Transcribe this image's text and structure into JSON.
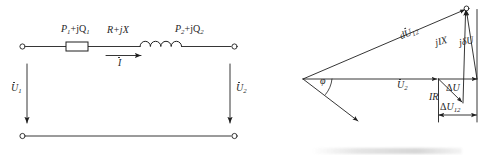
{
  "figure": {
    "stroke_color": "#1f1f1f",
    "background": "#ffffff"
  },
  "circuit_diagram": {
    "name": "single-phase-line-equivalent-circuit",
    "labels": {
      "sending_power": "P₁+jQ₁",
      "impedance": "R+jX",
      "current": "I",
      "receiving_power": "P₂+jQ₂",
      "sending_voltage": "U₁",
      "receiving_voltage": "U₂"
    },
    "label_parts": {
      "sending_power_main": "P",
      "sending_power_sub": "1",
      "sending_power_tail": "+jQ",
      "sending_power_sub2": "1",
      "receiving_power_main": "P",
      "receiving_power_sub": "2",
      "receiving_power_tail": "+jQ",
      "receiving_power_sub2": "2",
      "impedance_text": "R+jX",
      "current_text": "I",
      "u1_main": "U",
      "u1_sub": "1",
      "u2_main": "U",
      "u2_sub": "2"
    },
    "components": [
      {
        "name": "resistor",
        "type": "rectangle"
      },
      {
        "name": "inductor",
        "type": "coil",
        "loops": 4
      },
      {
        "name": "terminal-top-left",
        "type": "open-circle"
      },
      {
        "name": "terminal-top-right",
        "type": "open-circle"
      },
      {
        "name": "terminal-bottom-left",
        "type": "open-circle"
      },
      {
        "name": "terminal-bottom-right",
        "type": "open-circle"
      }
    ]
  },
  "phasor_diagram": {
    "name": "voltage-drop-phasor-diagram",
    "labels": {
      "phase_angle": "φ",
      "receiving_voltage": "U₂",
      "total_drop": "dU₁₂",
      "reactive_drop": "jIX",
      "quadrature_drop": "jδU",
      "resistive_drop": "IR",
      "longitudinal_drop": "ΔU",
      "transverse_drop": "ΔU₁₂"
    },
    "label_parts": {
      "phi": "φ",
      "u2_main": "U",
      "u2_sub": "2",
      "dU12_prefix": "d",
      "dU12_main": "U",
      "dU12_sub": "12",
      "jIX": "jIX",
      "jdU_j": "j",
      "jdU_delta": "δ",
      "jdU_u": "U",
      "IR": "IR",
      "deltaU_delta": "Δ",
      "deltaU_u": "U",
      "deltaU12_delta": "Δ",
      "deltaU12_u": "U",
      "deltaU12_sub": "12"
    },
    "vectors": [
      {
        "name": "u2-phasor",
        "label": "U₂",
        "from": [
          303,
          79
        ],
        "to": [
          438,
          79
        ]
      },
      {
        "name": "total-voltage-drop",
        "label": "dU₁₂",
        "from": [
          303,
          79
        ],
        "to": [
          466,
          9
        ]
      },
      {
        "name": "current-phasor",
        "label": "",
        "from": [
          303,
          79
        ],
        "to": [
          360,
          122
        ]
      },
      {
        "name": "resistive-drop",
        "label": "IR",
        "from": [
          438,
          79
        ],
        "to": [
          463,
          103
        ]
      },
      {
        "name": "reactive-drop",
        "label": "jIX",
        "from": [
          463,
          103
        ],
        "to": [
          466,
          9
        ]
      },
      {
        "name": "quadrature-drop",
        "label": "jδU",
        "from": [
          477,
          79
        ],
        "to": [
          466,
          9
        ]
      },
      {
        "name": "longitudinal-drop",
        "label": "ΔU",
        "from": [
          438,
          79
        ],
        "to": [
          477,
          79
        ]
      },
      {
        "name": "transverse-drop",
        "label": "ΔU₁₂",
        "from": [
          438,
          115
        ],
        "to": [
          477,
          115
        ]
      }
    ],
    "angle_arc": {
      "name": "phi-angle-arc",
      "vertex": [
        303,
        79
      ],
      "value": "φ"
    }
  }
}
